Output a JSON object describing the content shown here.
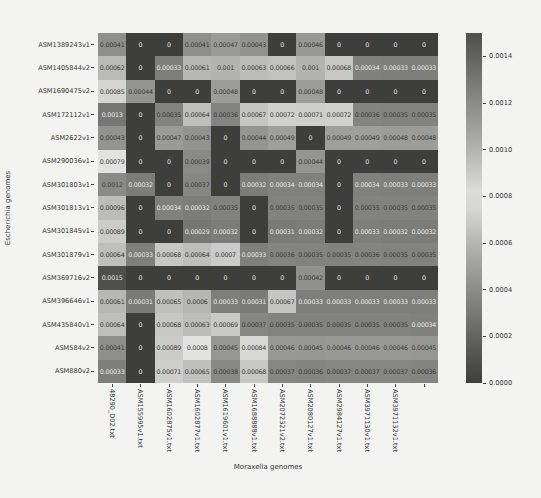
{
  "chart_data": {
    "type": "heatmap",
    "title": "",
    "xlabel": "Moraxella genomes",
    "ylabel": "Escherichia genomes",
    "colormap": "diverging (dark-light-dark, grayscale render)",
    "vmin": 0.0,
    "vmax": 0.0015,
    "annotations": true,
    "colorbar": {
      "position": "right",
      "ticks": [
        "0.0014",
        "0.0012",
        "0.0010",
        "0.0008",
        "0.0006",
        "0.0004",
        "0.0002",
        "0.0000"
      ],
      "tick_values": [
        0.0014,
        0.0012,
        0.001,
        0.0008,
        0.0006,
        0.0004,
        0.0002,
        0.0
      ]
    },
    "columns": [
      "48290_D02.txt",
      "ASM155995v1.txt",
      "ASM1602875v1.txt",
      "ASM1602877v1.txt",
      "ASM1619601v1.txt",
      "ASM1688888v1.txt",
      "ASM2072321v2.txt",
      "ASM2080127v1.txt",
      "ASM2984127v1.txt",
      "ASM3971130v1.txt",
      "ASM3971132v1.txt"
    ],
    "rows": [
      "ASM1389243v1",
      "ASM1405844v2",
      "ASM1690475v2",
      "ASM172112v1",
      "ASM2622v1",
      "ASM290036v1",
      "ASM301803v1",
      "ASM301813v1",
      "ASM301845v1",
      "ASM301879v1",
      "ASM369716v2",
      "ASM396646v1",
      "ASM435840v1",
      "ASM584v2",
      "ASM880v2"
    ],
    "values": [
      [
        "0.00041",
        "0",
        "0",
        "0.00041",
        "0.00047",
        "0.00043",
        "0",
        "0.00046",
        "0",
        "0",
        "0",
        "0"
      ],
      [
        "0.00062",
        "0",
        "0.00033",
        "0.00061",
        "0.001",
        "0.00063",
        "0.00066",
        "0.001",
        "0.00068",
        "0.00034",
        "0.00033",
        "0.00033"
      ],
      [
        "0.00085",
        "0.00044",
        "0",
        "0",
        "0.00048",
        "0",
        "0",
        "0.00048",
        "0",
        "0",
        "0",
        "0"
      ],
      [
        "0.0013",
        "0",
        "0.00035",
        "0.00064",
        "0.00036",
        "0.00067",
        "0.00072",
        "0.00071",
        "0.00072",
        "0.00036",
        "0.00035",
        "0.00035"
      ],
      [
        "0.00043",
        "0",
        "0.00047",
        "0.00043",
        "0",
        "0.00044",
        "0.00049",
        "0",
        "0.00049",
        "0.00049",
        "0.00048",
        "0.00048"
      ],
      [
        "0.00079",
        "0",
        "0",
        "0.00039",
        "0",
        "0",
        "0",
        "0.00044",
        "0",
        "0",
        "0",
        "0"
      ],
      [
        "0.0012",
        "0.00032",
        "0",
        "0.00037",
        "0",
        "0.00032",
        "0.00034",
        "0.00034",
        "0",
        "0.00034",
        "0.00033",
        "0.00033"
      ],
      [
        "0.00096",
        "0",
        "0.00034",
        "0.00032",
        "0.00035",
        "0",
        "0.00035",
        "0.00035",
        "0",
        "0.00035",
        "0.00035",
        "0.00035"
      ],
      [
        "0.00089",
        "0",
        "0",
        "0.00029",
        "0.00032",
        "0",
        "0.00031",
        "0.00032",
        "0",
        "0.00033",
        "0.00032",
        "0.00032"
      ],
      [
        "0.00064",
        "0.00033",
        "0.00068",
        "0.00064",
        "0.0007",
        "0.00033",
        "0.00036",
        "0.00035",
        "0.00035",
        "0.00036",
        "0.00035",
        "0.00035"
      ],
      [
        "0.0015",
        "0",
        "0",
        "0",
        "0",
        "0",
        "0",
        "0.00042",
        "0",
        "0",
        "0",
        "0"
      ],
      [
        "0.00061",
        "0.00031",
        "0.00065",
        "0.0006",
        "0.00033",
        "0.00031",
        "0.00067",
        "0.00033",
        "0.00033",
        "0.00033",
        "0.00033",
        "0.00033"
      ],
      [
        "0.00064",
        "0",
        "0.00068",
        "0.00063",
        "0.00069",
        "0.00037",
        "0.00035",
        "0.00035",
        "0.00035",
        "0.00035",
        "0.00035",
        "0.00034"
      ],
      [
        "0.00041",
        "0",
        "0.00089",
        "0.0008",
        "0.00045",
        "0.00084",
        "0.00046",
        "0.00045",
        "0.00046",
        "0.00046",
        "0.00046",
        "0.00045"
      ],
      [
        "0.00033",
        "0",
        "0.00071",
        "0.00065",
        "0.00038",
        "0.00068",
        "0.00037",
        "0.00036",
        "0.00037",
        "0.00037",
        "0.00037",
        "0.00036"
      ]
    ]
  }
}
